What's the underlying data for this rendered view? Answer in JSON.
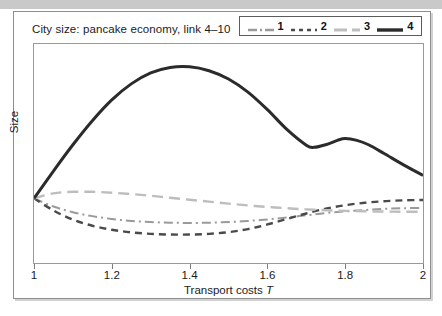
{
  "figure": {
    "title": "City size: pancake economy, link 4–10",
    "background_color": "#ffffff",
    "border_color": "#8e8e8e",
    "top_band_color": "#c9c9c9"
  },
  "legend": {
    "position": "top-right",
    "entries": [
      {
        "label": "1",
        "color": "#9a9a9a",
        "dash": "dashdot",
        "width": 2.0
      },
      {
        "label": "2",
        "color": "#4a4a4a",
        "dash": "dashed",
        "width": 2.4
      },
      {
        "label": "3",
        "color": "#bdbdbd",
        "dash": "longdash",
        "width": 2.4
      },
      {
        "label": "4",
        "color": "#2b2b2b",
        "dash": "solid",
        "width": 3.0
      }
    ]
  },
  "chart_data": {
    "type": "line",
    "title": "City size: pancake economy, link 4–10",
    "xlabel": "Transport costs T",
    "ylabel": "Size",
    "xlim": [
      1,
      2
    ],
    "ylim": [
      0,
      1
    ],
    "grid": false,
    "legend_position": "top-right",
    "xticks": [
      1,
      1.2,
      1.4,
      1.6,
      1.8,
      2
    ],
    "xticklabels": [
      "1",
      "1.2",
      "1.4",
      "1.6",
      "1.8",
      "2"
    ],
    "yticks": [],
    "yticklabels": [],
    "series": [
      {
        "name": "1",
        "color": "#9a9a9a",
        "dash": "dashdot",
        "width": 2.0,
        "x": [
          1.0,
          1.05,
          1.1,
          1.15,
          1.2,
          1.25,
          1.3,
          1.35,
          1.4,
          1.45,
          1.5,
          1.55,
          1.6,
          1.65,
          1.7,
          1.75,
          1.8,
          1.85,
          1.9,
          1.95,
          2.0
        ],
        "y": [
          0.295,
          0.258,
          0.232,
          0.214,
          0.201,
          0.192,
          0.187,
          0.184,
          0.183,
          0.184,
          0.187,
          0.192,
          0.199,
          0.208,
          0.218,
          0.228,
          0.236,
          0.242,
          0.247,
          0.25,
          0.252
        ]
      },
      {
        "name": "2",
        "color": "#4a4a4a",
        "dash": "dashed",
        "width": 2.4,
        "x": [
          1.0,
          1.05,
          1.1,
          1.15,
          1.2,
          1.25,
          1.3,
          1.35,
          1.4,
          1.45,
          1.5,
          1.55,
          1.6,
          1.65,
          1.7,
          1.75,
          1.8,
          1.85,
          1.9,
          1.95,
          2.0
        ],
        "y": [
          0.295,
          0.24,
          0.198,
          0.17,
          0.152,
          0.14,
          0.133,
          0.13,
          0.13,
          0.133,
          0.141,
          0.155,
          0.176,
          0.201,
          0.226,
          0.248,
          0.264,
          0.275,
          0.282,
          0.286,
          0.288
        ]
      },
      {
        "name": "3",
        "color": "#bdbdbd",
        "dash": "longdash",
        "width": 2.4,
        "x": [
          1.0,
          1.05,
          1.1,
          1.15,
          1.2,
          1.25,
          1.3,
          1.35,
          1.4,
          1.45,
          1.5,
          1.55,
          1.6,
          1.65,
          1.7,
          1.75,
          1.8,
          1.85,
          1.9,
          1.95,
          2.0
        ],
        "y": [
          0.295,
          0.318,
          0.325,
          0.325,
          0.321,
          0.315,
          0.307,
          0.298,
          0.289,
          0.28,
          0.271,
          0.263,
          0.256,
          0.25,
          0.245,
          0.241,
          0.238,
          0.236,
          0.235,
          0.234,
          0.234
        ]
      },
      {
        "name": "4",
        "color": "#2b2b2b",
        "dash": "solid",
        "width": 3.0,
        "x": [
          1.0,
          1.05,
          1.1,
          1.15,
          1.2,
          1.25,
          1.3,
          1.35,
          1.4,
          1.45,
          1.5,
          1.55,
          1.6,
          1.65,
          1.7,
          1.72,
          1.75,
          1.78,
          1.8,
          1.83,
          1.86,
          1.9,
          1.95,
          2.0
        ],
        "y": [
          0.295,
          0.42,
          0.54,
          0.65,
          0.745,
          0.818,
          0.868,
          0.893,
          0.896,
          0.878,
          0.84,
          0.78,
          0.7,
          0.61,
          0.538,
          0.528,
          0.54,
          0.56,
          0.568,
          0.56,
          0.54,
          0.5,
          0.448,
          0.4
        ]
      }
    ]
  },
  "axes": {
    "x_label_prefix": "Transport costs",
    "x_label_symbol": "T",
    "y_label": "Size"
  }
}
